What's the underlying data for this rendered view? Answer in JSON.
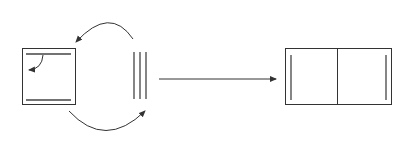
{
  "diagram": {
    "type": "process-flow",
    "stroke_color": "#333333",
    "background": "#ffffff",
    "nodes": [
      {
        "id": "left-box",
        "shape": "square",
        "description": "square frame with two horizontal inner lines (top and bottom) and a small curved arrow inside"
      },
      {
        "id": "three-lines",
        "shape": "three-vertical-lines",
        "description": "three parallel vertical lines"
      },
      {
        "id": "right-box",
        "shape": "rectangle-split",
        "description": "rectangle divided in two halves with a vertical inner line near each outer side"
      }
    ],
    "edges": [
      {
        "from": "three-lines",
        "to": "left-box",
        "style": "curved-arrow-top"
      },
      {
        "from": "left-box",
        "to": "three-lines",
        "style": "curved-arrow-bottom"
      },
      {
        "from": "three-lines",
        "to": "right-box",
        "style": "straight-arrow"
      }
    ],
    "labels": []
  }
}
